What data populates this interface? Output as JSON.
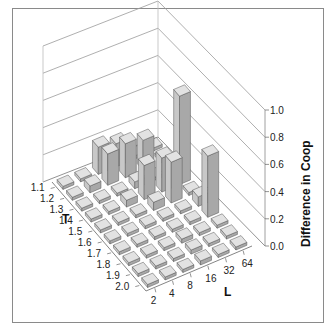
{
  "chart_data": {
    "type": "bar3d",
    "title": "",
    "xlabel": "L",
    "ylabel": "T",
    "zlabel": "Difference in Coop",
    "x_categories": [
      "2",
      "4",
      "8",
      "16",
      "32",
      "64"
    ],
    "y_categories": [
      "1.1",
      "1.2",
      "1.3",
      "1.4",
      "1.5",
      "1.6",
      "1.7",
      "1.8",
      "1.9",
      "2.0"
    ],
    "z_ticks": [
      "0.0",
      "0.2",
      "0.4",
      "0.6",
      "0.8",
      "1.0"
    ],
    "zlim": [
      0,
      1.0
    ],
    "grid": true,
    "values": [
      [
        0.02,
        0.02,
        0.2,
        0.17,
        0.01,
        0.01
      ],
      [
        0.01,
        0.05,
        0.23,
        0.25,
        0.22,
        0.01
      ],
      [
        0.01,
        0.01,
        0.01,
        0.05,
        0.01,
        0.01
      ],
      [
        0.01,
        0.01,
        0.05,
        0.25,
        0.25,
        0.65
      ],
      [
        0.01,
        0.01,
        0.01,
        0.06,
        0.3,
        0.02
      ],
      [
        0.01,
        0.01,
        0.01,
        0.02,
        0.01,
        0.07
      ],
      [
        0.01,
        0.01,
        0.01,
        0.02,
        0.01,
        0.45
      ],
      [
        0.01,
        0.01,
        0.02,
        0.03,
        0.01,
        0.01
      ],
      [
        0.01,
        0.01,
        0.02,
        0.03,
        0.01,
        0.01
      ],
      [
        0.01,
        0.01,
        0.01,
        0.03,
        0.01,
        0.01
      ]
    ]
  },
  "axes": {
    "x_label": "L",
    "y_label": "T",
    "z_label": "Difference in Coop"
  },
  "colors": {
    "bar_front": "#c8c8c8",
    "bar_side": "#a8a8a8",
    "bar_top": "#e2e2e2",
    "bar_edge": "#555555",
    "grid": "#9a9a9a",
    "frame": "#8a8a8a"
  }
}
